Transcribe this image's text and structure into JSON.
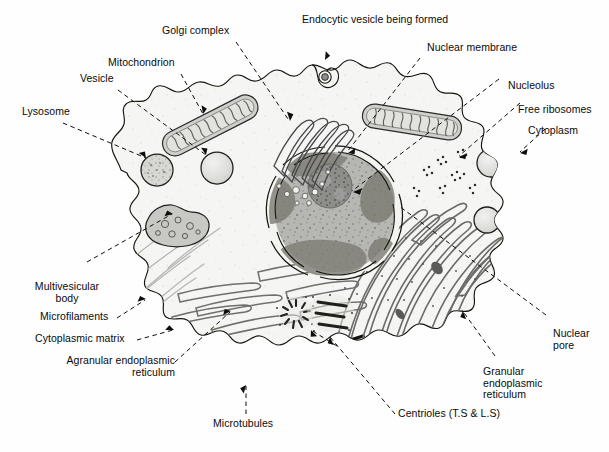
{
  "diagram": {
    "background_color": "#ffffff",
    "ink_color": "#111111",
    "cytoplasm_color": "#f4f4f2",
    "nucleus_color": "#b9b9b7",
    "nucleolus_color": "#8e8e8c",
    "organelle_fill": "#d8d8d6"
  },
  "labels": [
    {
      "id": "lysosome",
      "text": "Lysosome"
    },
    {
      "id": "vesicle",
      "text": "Vesicle"
    },
    {
      "id": "mitochondrion",
      "text": "Mitochondrion"
    },
    {
      "id": "golgi_complex",
      "text": "Golgi complex"
    },
    {
      "id": "endocytic_vesicle",
      "text": "Endocytic vesicle being formed"
    },
    {
      "id": "nuclear_membrane",
      "text": "Nuclear membrane"
    },
    {
      "id": "nucleolus",
      "text": "Nucleolus"
    },
    {
      "id": "free_ribosomes",
      "text": "Free ribosomes"
    },
    {
      "id": "cytoplasm",
      "text": "Cytoplasm"
    },
    {
      "id": "nuclear_pore",
      "text": "Nuclear\npore"
    },
    {
      "id": "granular_er",
      "text": "Granular\nendoplasmic\nreticulum"
    },
    {
      "id": "centrioles",
      "text": "Centrioles (T.S & L.S)"
    },
    {
      "id": "microtubules",
      "text": "Microtubules"
    },
    {
      "id": "agranular_er",
      "text": "Agranular endoplasmic\nreticulum"
    },
    {
      "id": "cytoplasmic_matrix",
      "text": "Cytoplasmic matrix"
    },
    {
      "id": "microfilaments",
      "text": "Microfilaments"
    },
    {
      "id": "multivesicular_body",
      "text": "Multivesicular\nbody"
    }
  ],
  "structures": [
    {
      "id": "cell-membrane",
      "name": "cell membrane"
    },
    {
      "id": "nucleus",
      "name": "nucleus"
    },
    {
      "id": "nucleolus",
      "name": "nucleolus"
    },
    {
      "id": "mitochondrion-left",
      "name": "mitochondrion"
    },
    {
      "id": "mitochondrion-right",
      "name": "mitochondrion"
    },
    {
      "id": "golgi-complex",
      "name": "golgi complex"
    },
    {
      "id": "lysosome",
      "name": "lysosome"
    },
    {
      "id": "vesicle",
      "name": "vesicle"
    },
    {
      "id": "multivesicular-body",
      "name": "multivesicular body"
    },
    {
      "id": "endocytic-vesicle",
      "name": "endocytic vesicle"
    },
    {
      "id": "free-ribosomes",
      "name": "free ribosomes"
    },
    {
      "id": "granular-er",
      "name": "granular endoplasmic reticulum"
    },
    {
      "id": "agranular-er",
      "name": "agranular endoplasmic reticulum"
    },
    {
      "id": "microfilaments",
      "name": "microfilaments"
    },
    {
      "id": "microtubules",
      "name": "microtubules"
    },
    {
      "id": "centriole-ts",
      "name": "centriole transverse section"
    },
    {
      "id": "centriole-ls",
      "name": "centriole longitudinal section"
    },
    {
      "id": "cytoplasmic-vesicles",
      "name": "cytoplasmic vesicles"
    }
  ]
}
